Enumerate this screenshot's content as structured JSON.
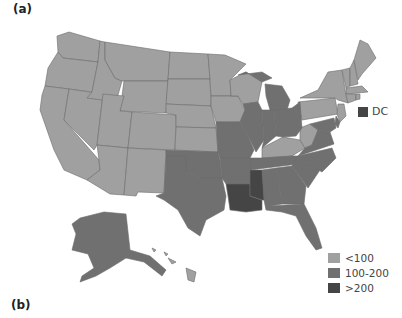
{
  "panels": {
    "a": "(a)",
    "b": "(b)"
  },
  "colors": {
    "low": "#a0a0a0",
    "mid": "#707070",
    "high": "#454545"
  },
  "legend": {
    "items": [
      {
        "label": "<100",
        "color": "#a0a0a0"
      },
      {
        "label": "100-200",
        "color": "#707070"
      },
      {
        "label": ">200",
        "color": "#454545"
      }
    ]
  },
  "dc_marker": {
    "label": "DC",
    "color": "#454545"
  },
  "categories": {
    "<100": [
      "WA",
      "OR",
      "CA",
      "NV",
      "ID",
      "MT",
      "WY",
      "UT",
      "AZ",
      "CO",
      "NM",
      "ND",
      "SD",
      "NE",
      "KS",
      "MN",
      "IA",
      "WI",
      "KY",
      "WV",
      "PA",
      "NY",
      "VT",
      "NH",
      "ME",
      "MA",
      "CT",
      "RI",
      "NJ",
      "HI"
    ],
    "100-200": [
      "AK",
      "TX",
      "OK",
      "MO",
      "AR",
      "IL",
      "IN",
      "MI",
      "OH",
      "TN",
      "AL",
      "GA",
      "FL",
      "SC",
      "NC",
      "VA",
      "MD",
      "DE"
    ],
    ">200": [
      "LA",
      "MS",
      "DC"
    ]
  }
}
